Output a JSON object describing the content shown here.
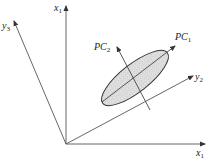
{
  "diagram": {
    "labels": {
      "x1_vertical": {
        "base": "x",
        "sub": "1"
      },
      "x1_horizontal": {
        "base": "x",
        "sub": "1"
      },
      "y3": {
        "base": "y",
        "sub": "3"
      },
      "y2": {
        "base": "y",
        "sub": "2"
      },
      "pc1": {
        "base": "PC",
        "sub": "1"
      },
      "pc2": {
        "base": "PC",
        "sub": "2"
      }
    },
    "colors": {
      "line": "#555555",
      "ellipse_stroke": "#333333",
      "ellipse_fill": "#d8d8d8",
      "stipple": "#888888"
    }
  }
}
